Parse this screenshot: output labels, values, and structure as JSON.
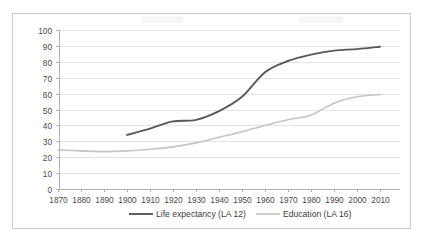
{
  "chart_data": {
    "type": "line",
    "title": "",
    "xlabel": "",
    "ylabel": "",
    "xlim": [
      1865,
      2015
    ],
    "ylim": [
      0,
      100
    ],
    "grid": true,
    "legend_position": "bottom",
    "x_ticks": [
      1870,
      1880,
      1890,
      1900,
      1910,
      1920,
      1930,
      1940,
      1950,
      1960,
      1970,
      1980,
      1990,
      2000,
      2010
    ],
    "y_ticks": [
      0,
      10,
      20,
      30,
      40,
      50,
      60,
      70,
      80,
      90,
      100
    ],
    "series": [
      {
        "name": "Life expectancy (LA 12)",
        "color": "#595959",
        "width": 1.9,
        "x": [
          1900,
          1910,
          1920,
          1930,
          1940,
          1950,
          1960,
          1970,
          1980,
          1990,
          2000,
          2010
        ],
        "values": [
          34,
          38,
          42.5,
          43.5,
          49,
          58,
          73.5,
          80.5,
          84.5,
          87,
          88,
          89.5
        ]
      },
      {
        "name": "Education (LA 16)",
        "color": "#c4c4c4",
        "width": 1.6,
        "x": [
          1870,
          1880,
          1890,
          1900,
          1910,
          1920,
          1930,
          1940,
          1950,
          1960,
          1970,
          1980,
          1990,
          2000,
          2010
        ],
        "values": [
          24.5,
          24,
          23.5,
          24,
          25,
          26.5,
          29,
          32.5,
          36,
          40,
          43.5,
          46.5,
          54,
          58,
          59.5
        ]
      }
    ]
  },
  "legend": {
    "items": [
      {
        "label": "Life expectancy (LA 12)"
      },
      {
        "label": "Education (LA 16)"
      }
    ]
  }
}
